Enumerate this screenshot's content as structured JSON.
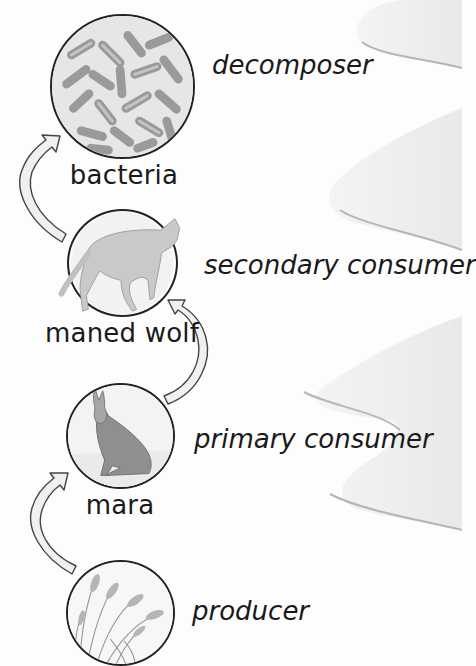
{
  "diagram": {
    "type": "food-chain",
    "direction": "bottom-to-top",
    "levels": [
      {
        "organism": "bacteria",
        "role": "decomposer",
        "icon": "bacteria-illustration"
      },
      {
        "organism": "maned wolf",
        "role": "secondary consumer",
        "icon": "maned-wolf-illustration"
      },
      {
        "organism": "mara",
        "role": "primary consumer",
        "icon": "mara-illustration"
      },
      {
        "organism": "",
        "role": "producer",
        "icon": "grass-illustration"
      }
    ],
    "arrows": [
      {
        "from": "producer",
        "to": "mara"
      },
      {
        "from": "mara",
        "to": "maned wolf"
      },
      {
        "from": "maned wolf",
        "to": "bacteria"
      }
    ]
  },
  "colors": {
    "background": "#fdfdfd",
    "wave": "#eeeeee",
    "wave_shadow": "#b8b8b8",
    "arrow_fill": "#f0f0f0",
    "arrow_stroke": "#444444",
    "outline": "#222222"
  }
}
